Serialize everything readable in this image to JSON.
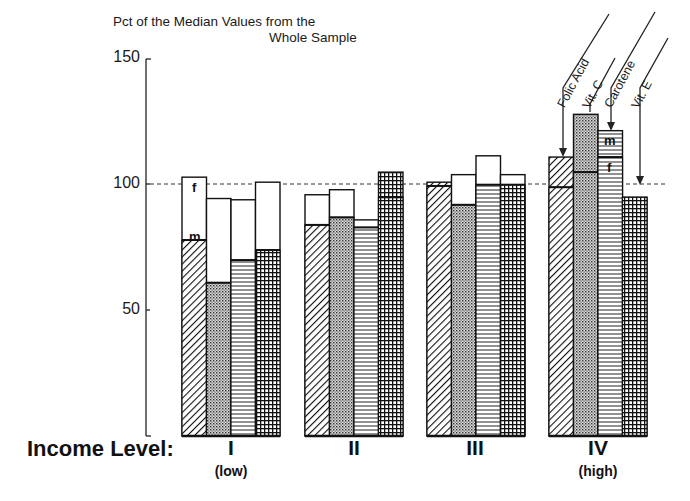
{
  "chart_data": {
    "type": "bar",
    "title_line1": "Pct of the Median Values from the",
    "title_line2": "Whole Sample",
    "xlabel": "Income Level:",
    "ylabel": "",
    "ylim": [
      0,
      150
    ],
    "yticks": [
      50,
      100,
      150
    ],
    "yticks_labels": [
      "50",
      "100",
      "150"
    ],
    "reference_line": 100,
    "grid": false,
    "categories": [
      "I",
      "II",
      "III",
      "IV"
    ],
    "category_sublabels": [
      "(low)",
      "",
      "",
      "(high)"
    ],
    "legend": [
      "Folic Acid",
      "Vit. C",
      "Carotene",
      "Vit. E"
    ],
    "legend_position": "top-right, rotated labels with arrows pointing to group IV bars",
    "segment_labels": {
      "m": "m",
      "f": "f"
    },
    "series": [
      {
        "name": "Folic Acid",
        "pattern": "diagonal-hatch",
        "lower_values": [
          78,
          84,
          99.5,
          99
        ],
        "upper_values": [
          103,
          96,
          101,
          111
        ]
      },
      {
        "name": "Vit. C",
        "pattern": "dots",
        "lower_values": [
          61,
          87,
          92,
          105
        ],
        "upper_values": [
          94.5,
          98,
          104,
          128
        ]
      },
      {
        "name": "Carotene",
        "pattern": "horizontal-lines",
        "lower_values": [
          70,
          83,
          100,
          111
        ],
        "upper_values": [
          94,
          86,
          111.5,
          121.5
        ]
      },
      {
        "name": "Vit. E",
        "pattern": "grid",
        "lower_values": [
          74,
          95,
          100,
          95
        ],
        "upper_values": [
          101,
          105,
          104,
          95
        ]
      }
    ]
  }
}
